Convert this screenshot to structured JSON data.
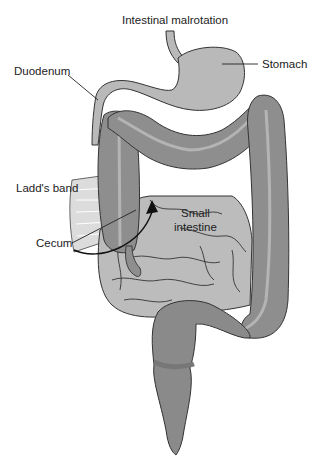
{
  "title": "Intestinal malrotation",
  "labels": {
    "stomach": "Stomach",
    "duodenum": "Duodenum",
    "ladds_band": "Ladd's band",
    "cecum": "Cecum",
    "small_intestine_line1": "Small",
    "small_intestine_line2": "intestine"
  },
  "colors": {
    "background": "#ffffff",
    "stomach_fill": "#b9b9b9",
    "small_intestine_fill": "#bcbcbc",
    "colon_fill": "#8e8e8e",
    "colon_stripe": "#b4b4b4",
    "rectum_fill": "#8a8a8a",
    "outline": "#333333",
    "band_fill": "#dcdcdc",
    "text": "#222222"
  }
}
